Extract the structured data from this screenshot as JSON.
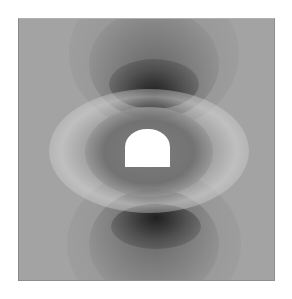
{
  "figure": {
    "colors": {
      "background": "#a3a3a3",
      "dark_lobe": "#1a1a1a",
      "bright_ring": "#ebebeb",
      "opening": "#ffffff"
    },
    "elements": {
      "opening": {
        "shape": "horseshoe",
        "fill": "#ffffff"
      },
      "ring": {
        "shape": "ellipse",
        "tone": "bright"
      },
      "lobes": [
        {
          "position": "top",
          "tone": "dark"
        },
        {
          "position": "bottom",
          "tone": "dark"
        }
      ]
    }
  }
}
